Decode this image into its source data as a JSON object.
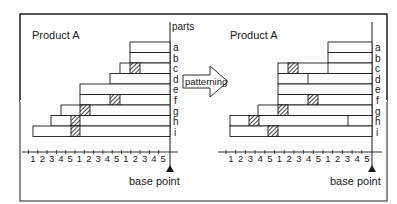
{
  "left_panel": {
    "title": "Product A",
    "parts_label": "parts",
    "base_label": "base point",
    "rows": [
      "a",
      "b",
      "c",
      "d",
      "e",
      "f",
      "g",
      "h",
      "i"
    ],
    "axis_labels": [
      "1",
      "2",
      "3",
      "4",
      "5",
      "1",
      "2",
      "3",
      "4",
      "5",
      "1",
      "2",
      "3",
      "4",
      "5"
    ]
  },
  "arrow": {
    "label": "patterning"
  },
  "right_panel": {
    "title": "Product A",
    "base_label": "base point",
    "rows": [
      "a",
      "b",
      "c",
      "d",
      "e",
      "f",
      "g",
      "h",
      "i"
    ],
    "axis_labels": [
      "1",
      "2",
      "3",
      "4",
      "5",
      "1",
      "2",
      "3",
      "4",
      "5",
      "1",
      "2",
      "3",
      "4",
      "5"
    ]
  },
  "colors": {
    "line": "#1a1a1a",
    "background": "#ffffff",
    "hatch": "#1a1a1a"
  }
}
